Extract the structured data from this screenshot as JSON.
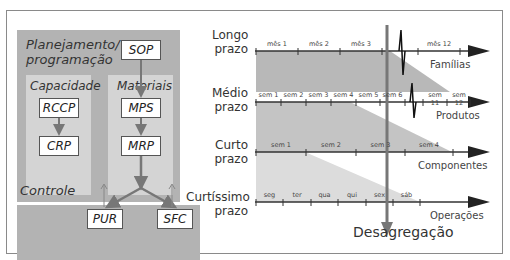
{
  "left": {
    "planning_title": "Planejamento/\nprogramação",
    "planning_line1": "Planejamento/",
    "planning_line2": "programação",
    "capacity_title": "Capacidade",
    "materials_title": "Materiais",
    "control_title": "Controle",
    "boxes": {
      "sop": "SOP",
      "rccp": "RCCP",
      "crp": "CRP",
      "mps": "MPS",
      "mrp": "MRP",
      "pur": "PUR",
      "sfc": "SFC"
    }
  },
  "right": {
    "horizons": [
      {
        "line1": "Longo",
        "line2": "prazo",
        "axis_name": "Famílias",
        "ticks": [
          "mês 1",
          "mês 2",
          "mês 3",
          "mês 12"
        ]
      },
      {
        "line1": "Médio",
        "line2": "prazo",
        "axis_name": "Produtos",
        "ticks": [
          "sem 1",
          "sem 2",
          "sem 3",
          "sem 4",
          "sem 5",
          "sem 6",
          "sem 11",
          "sem 12"
        ]
      },
      {
        "line1": "Curto",
        "line2": "prazo",
        "axis_name": "Componentes",
        "ticks": [
          "sem 1",
          "sem 2",
          "sem 3",
          "sem 4"
        ]
      },
      {
        "line1": "Curtíssimo",
        "line2": "prazo",
        "axis_name": "Operações",
        "ticks": [
          "seg",
          "ter",
          "qua",
          "qui",
          "sex",
          "sáb"
        ]
      }
    ],
    "disaggregation_label": "Desagregação"
  },
  "colors": {
    "panel_dark": "#b3b3b3",
    "panel_light": "#d4d4d4",
    "band1": "#b8b8b8",
    "band2": "#c4c4c4",
    "band3": "#dcdcdc",
    "axis": "#333333",
    "arrow": "#777777"
  }
}
